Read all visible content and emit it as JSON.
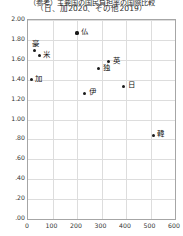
{
  "chart_data": {
    "type": "scatter",
    "title": "（日、加2020、その他2019）",
    "title_top_clipped": "（参考）主要国の国民負担率の国際比較",
    "xlabel": "",
    "ylabel": "",
    "xlim": [
      0,
      600
    ],
    "ylim": [
      0,
      2.0
    ],
    "xticks": [
      "0",
      "100",
      "200",
      "300",
      "400",
      "500",
      "600"
    ],
    "xtick_values": [
      0,
      100,
      200,
      300,
      400,
      500,
      600
    ],
    "yticks": [
      ".00",
      ".20",
      ".40",
      ".60",
      ".80",
      "1.00",
      "1.20",
      "1.40",
      "1.60",
      "1.80",
      "2.00"
    ],
    "ytick_values": [
      0.0,
      0.2,
      0.4,
      0.6,
      0.8,
      1.0,
      1.2,
      1.4,
      1.6,
      1.8,
      2.0
    ],
    "grid": true,
    "legend": "none",
    "points": [
      {
        "label": "仏",
        "x": 200,
        "y": 1.87,
        "label_pos": "right"
      },
      {
        "label": "豪",
        "x": 26,
        "y": 1.69,
        "label_pos": "above"
      },
      {
        "label": "米",
        "x": 46,
        "y": 1.64,
        "label_pos": "right"
      },
      {
        "label": "英",
        "x": 330,
        "y": 1.58,
        "label_pos": "right"
      },
      {
        "label": "独",
        "x": 288,
        "y": 1.51,
        "label_pos": "right"
      },
      {
        "label": "加",
        "x": 14,
        "y": 1.4,
        "label_pos": "right"
      },
      {
        "label": "日",
        "x": 390,
        "y": 1.33,
        "label_pos": "right"
      },
      {
        "label": "伊",
        "x": 232,
        "y": 1.26,
        "label_pos": "right"
      },
      {
        "label": "韓",
        "x": 512,
        "y": 0.84,
        "label_pos": "right"
      }
    ]
  }
}
